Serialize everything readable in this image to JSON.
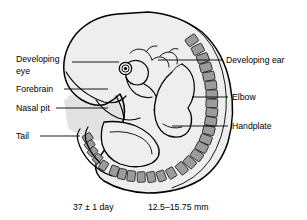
{
  "figure": {
    "background_color": "#ffffff",
    "body_fill_color": "#eeeeee",
    "somite_fill_color": "#9c9c9c",
    "outline_color": "#000000"
  },
  "labels": {
    "left": [
      {
        "id": "developing-eye",
        "line1": "Developing",
        "line2": "eye"
      },
      {
        "id": "forebrain",
        "line1": "Forebrain",
        "line2": ""
      },
      {
        "id": "nasal-pit",
        "line1": "Nasal pit",
        "line2": ""
      },
      {
        "id": "tail",
        "line1": "Tail",
        "line2": ""
      }
    ],
    "right": [
      {
        "id": "developing-ear",
        "text": "Developing ear"
      },
      {
        "id": "elbow",
        "text": "Elbow"
      },
      {
        "id": "handplate",
        "text": "Handplate"
      }
    ]
  },
  "caption": {
    "age": "37 ± 1 day",
    "length": "12.5–15.75 mm"
  }
}
